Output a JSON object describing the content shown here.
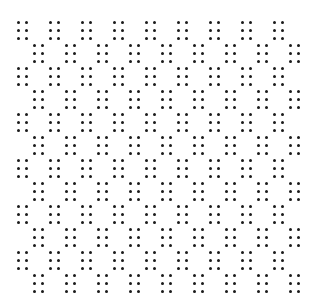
{
  "pattern": {
    "background": "#ffffff",
    "dot_color": "#1a1a1a",
    "dot_size": 3,
    "rows": 12,
    "clusters_per_row": 9,
    "row_start_y": 21,
    "row_step_y": 23,
    "even_row_start_x": 17,
    "odd_row_start_x": 33,
    "col_step_x": 32,
    "cluster": {
      "cols": 2,
      "rows": 3,
      "dx": 8,
      "dy": 8
    }
  }
}
